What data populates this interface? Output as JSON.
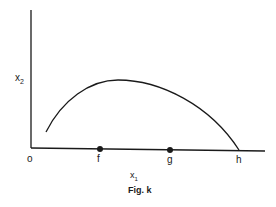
{
  "diagram": {
    "y_axis_label": "x",
    "y_axis_sub": "2",
    "x_axis_label": "x",
    "x_axis_sub": "1",
    "origin_label": "o",
    "points": [
      {
        "label": "f"
      },
      {
        "label": "g"
      },
      {
        "label": "h"
      }
    ],
    "caption": "Fig. k"
  }
}
